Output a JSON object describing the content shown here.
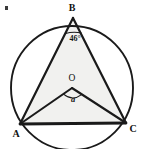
{
  "figure": {
    "background_color": "#ffffff",
    "stroke_color": "#1a1a1a",
    "triangle_fill_color": "#f1f1ef",
    "circle": {
      "center_label": "O",
      "center_x": 72,
      "center_y": 88,
      "radius_x": 61,
      "radius_y": 62
    },
    "vertices": [
      {
        "label": "B",
        "x": 73,
        "y": 18,
        "label_x": 72,
        "label_y": 10
      },
      {
        "label": "A",
        "x": 20,
        "y": 124,
        "label_x": 17,
        "label_y": 136
      },
      {
        "label": "C",
        "x": 126,
        "y": 123,
        "label_x": 131,
        "label_y": 132
      }
    ],
    "angles": [
      {
        "name": "inscribed-angle-at-b",
        "label": "46°",
        "value": 46,
        "unit": "degrees",
        "vertex": "B",
        "label_x": 75,
        "label_y": 34
      },
      {
        "name": "central-angle-aoc",
        "label": "a",
        "value": null,
        "unit": "degrees",
        "vertex": "O",
        "label_x": 73,
        "label_y": 101
      }
    ],
    "artifact": {
      "name": "scan-speck",
      "x": 5,
      "y": 6,
      "width": 3,
      "height": 4
    }
  }
}
